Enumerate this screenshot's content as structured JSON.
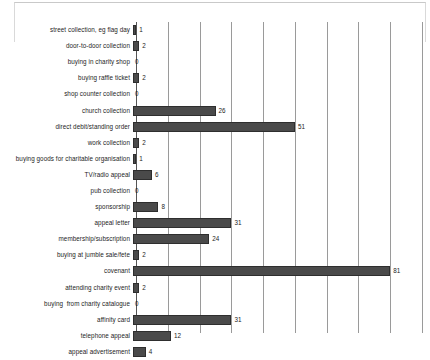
{
  "chart_data": {
    "type": "bar",
    "orientation": "horizontal",
    "title": "",
    "subtitle": "",
    "xlabel": "",
    "ylabel": "",
    "xlim": [
      0,
      90
    ],
    "grid": true,
    "grid_interval": 10,
    "legend": "none",
    "bar_color": "#4a4a4a",
    "bar_border_color": "#2e2e2e",
    "gridline_color": "#9a9a9a",
    "axis_color": "#555555",
    "text_color": "#1d1d1d",
    "categories": [
      "street collection, eg flag day",
      "door-to-door collection",
      "buying in charity shop",
      "buying raffle ticket",
      "shop counter collection",
      "church collection",
      "direct debit/standing order",
      "work collection",
      "buying goods for charitable organisation",
      "TV/radio appeal",
      "pub collection",
      "sponsorship",
      "appeal letter",
      "membership/subscription",
      "buying at jumble sale/fete",
      "covenant",
      "attending charity event",
      "buying  from charity catalogue",
      "affinity card",
      "telephone appeal",
      "appeal advertisement"
    ],
    "values": [
      1,
      2,
      0,
      2,
      0,
      26,
      51,
      2,
      1,
      6,
      0,
      8,
      31,
      24,
      2,
      81,
      2,
      0,
      31,
      12,
      4
    ],
    "value_labels": [
      "1",
      "2",
      "0",
      "2",
      "0",
      "26",
      "51",
      "2",
      "1",
      "6",
      "0",
      "8",
      "31",
      "24",
      "2",
      "81",
      "2",
      "0",
      "31",
      "12",
      "4"
    ],
    "gridline_values": [
      0,
      10,
      20,
      30,
      40,
      50,
      60,
      70,
      80,
      90
    ]
  }
}
